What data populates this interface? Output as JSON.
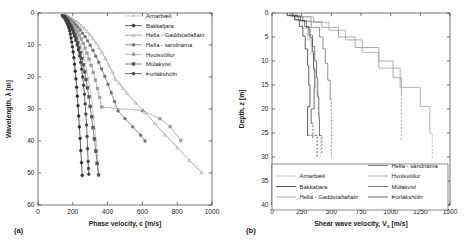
{
  "figure": {
    "panel_a_label": "(a)",
    "panel_b_label": "(b)"
  },
  "sites": [
    {
      "key": "arnarbaeli",
      "label": "Arnarbæli",
      "color": "#b9b9b9",
      "marker": "plus"
    },
    {
      "key": "bakkafjara",
      "label": "Bakkafjara",
      "color": "#2b2b2b",
      "marker": "circle-filled"
    },
    {
      "key": "hella_gaddstadaflatir",
      "label": "Hella - Gaddstaðaflatir",
      "color": "#8f8f8f",
      "marker": "triangle-open"
    },
    {
      "key": "hella_sandnama",
      "label": "Hella - sandnáma",
      "color": "#6e6e6e",
      "marker": "circle-filled"
    },
    {
      "key": "hvolsvollur",
      "label": "Hvolsvöllur",
      "color": "#9d9d9d",
      "marker": "square-filled"
    },
    {
      "key": "mulakvisl",
      "label": "Múlakvísl",
      "color": "#555555",
      "marker": "square-filled"
    },
    {
      "key": "thorlakshofn",
      "label": "Þorlákshöfn",
      "color": "#3f3f3f",
      "marker": "circle-filled"
    }
  ],
  "chart_data": [
    {
      "id": "panel-a",
      "type": "scatter",
      "title": "",
      "xlabel": "Phase velocity, c [m/s]",
      "ylabel": "Wavelength, λ [m]",
      "xlim": [
        0,
        1000
      ],
      "ylim": [
        0,
        60
      ],
      "y_inverted": true,
      "xticks": [
        0,
        200,
        400,
        600,
        800,
        1000
      ],
      "yticks": [
        0,
        10,
        20,
        30,
        40,
        50,
        60
      ],
      "grid": false,
      "legend_position": "top-right",
      "series": [
        {
          "name": "Arnarbæli",
          "x": [
            150,
            158,
            165,
            172,
            178,
            186,
            193,
            200,
            208,
            215,
            222,
            230,
            238,
            246,
            255,
            263,
            272,
            280,
            288,
            296,
            305,
            312,
            320,
            327,
            334,
            341,
            348
          ],
          "y": [
            1.0,
            1.4,
            1.8,
            2.2,
            2.7,
            3.2,
            3.8,
            4.4,
            5.1,
            5.9,
            6.8,
            7.8,
            9.0,
            10.4,
            12.0,
            13.8,
            15.8,
            18.0,
            20.4,
            23.0,
            26.0,
            29.2,
            32.6,
            36.2,
            40.0,
            44.5,
            49.6
          ]
        },
        {
          "name": "Bakkafjara",
          "x": [
            140,
            146,
            152,
            158,
            163,
            168,
            173,
            178,
            182,
            186,
            190,
            194,
            198,
            202,
            206,
            210,
            214,
            218,
            222,
            226,
            230,
            234,
            238,
            242,
            246,
            250,
            254
          ],
          "y": [
            0.8,
            1.2,
            1.6,
            2.1,
            2.6,
            3.2,
            3.9,
            4.7,
            5.6,
            6.6,
            7.8,
            9.1,
            10.6,
            12.2,
            14.0,
            16.0,
            18.2,
            20.6,
            23.2,
            26.0,
            29.0,
            32.2,
            35.6,
            39.2,
            43.0,
            46.8,
            50.8
          ]
        },
        {
          "name": "Hella - Gaddstaðaflatir",
          "x": [
            170,
            182,
            195,
            208,
            222,
            236,
            251,
            266,
            282,
            298,
            315,
            332,
            350,
            368,
            387,
            406,
            426,
            446,
            467,
            488,
            510,
            560,
            615,
            672,
            730,
            800,
            870,
            940
          ],
          "y": [
            0.9,
            1.3,
            1.7,
            2.2,
            2.7,
            3.3,
            4.0,
            4.8,
            5.7,
            6.7,
            7.9,
            9.2,
            10.7,
            12.3,
            14.1,
            16.1,
            18.3,
            20.7,
            22.0,
            23.5,
            25.0,
            28.0,
            31.0,
            34.5,
            38.0,
            42.0,
            46.0,
            49.8
          ]
        },
        {
          "name": "Hella - sandnáma",
          "x": [
            160,
            170,
            181,
            192,
            204,
            216,
            229,
            242,
            256,
            270,
            285,
            300,
            316,
            332,
            349,
            366,
            384,
            402,
            421,
            440,
            460,
            500,
            545,
            590,
            615
          ],
          "y": [
            1.0,
            1.4,
            1.9,
            2.4,
            3.0,
            3.7,
            4.4,
            5.3,
            6.3,
            7.4,
            8.7,
            10.1,
            11.7,
            13.5,
            15.4,
            17.5,
            19.8,
            22.3,
            24.9,
            27.7,
            30.6,
            33.0,
            35.6,
            38.2,
            40.0
          ]
        },
        {
          "name": "Hvolsvöllur",
          "x": [
            155,
            163,
            171,
            180,
            189,
            198,
            208,
            218,
            228,
            238,
            249,
            260,
            271,
            282,
            294,
            306,
            318,
            330,
            342,
            354,
            366,
            600,
            700,
            760,
            820
          ],
          "y": [
            1.0,
            1.4,
            1.9,
            2.4,
            3.0,
            3.6,
            4.3,
            5.1,
            6.0,
            7.0,
            8.2,
            9.5,
            11.0,
            12.6,
            14.4,
            16.4,
            18.6,
            21.0,
            23.6,
            26.4,
            29.4,
            30.5,
            33.0,
            35.5,
            39.8
          ]
        },
        {
          "name": "Múlakvísl",
          "x": [
            145,
            152,
            159,
            166,
            173,
            180,
            188,
            196,
            204,
            212,
            220,
            228,
            236,
            244,
            252,
            260,
            268,
            276,
            284,
            292,
            300,
            308,
            316,
            324,
            332,
            340,
            348
          ],
          "y": [
            0.9,
            1.3,
            1.7,
            2.2,
            2.8,
            3.4,
            4.1,
            4.9,
            5.8,
            6.8,
            8.0,
            9.3,
            10.8,
            12.4,
            14.2,
            16.2,
            18.4,
            20.8,
            23.4,
            26.2,
            29.2,
            32.4,
            35.8,
            39.4,
            43.2,
            47.0,
            50.6
          ]
        },
        {
          "name": "Þorlákshöfn",
          "x": [
            148,
            155,
            162,
            169,
            176,
            183,
            190,
            197,
            204,
            211,
            218,
            225,
            232,
            239,
            245,
            251,
            257,
            262,
            267,
            271,
            275,
            279,
            282,
            285,
            288,
            290,
            292
          ],
          "y": [
            0.9,
            1.3,
            1.7,
            2.2,
            2.8,
            3.5,
            4.3,
            5.2,
            6.2,
            7.3,
            8.6,
            10.0,
            11.6,
            13.4,
            15.4,
            17.6,
            20.0,
            22.6,
            25.4,
            28.4,
            31.6,
            35.0,
            38.6,
            42.4,
            46.4,
            48.6,
            50.4
          ]
        }
      ]
    },
    {
      "id": "panel-b",
      "type": "line",
      "title": "",
      "xlabel": "Shear wave velocity, V  [m/s]",
      "xlabel_main": "Shear wave velocity, V",
      "xlabel_sub": "s",
      "xlabel_unit": " [m/s]",
      "ylabel": "Depth, z [m]",
      "xlim": [
        0,
        1500
      ],
      "ylim": [
        0,
        40
      ],
      "y_inverted": true,
      "xticks": [
        0,
        250,
        500,
        750,
        1000,
        1250,
        1500
      ],
      "yticks": [
        0,
        5,
        10,
        15,
        20,
        25,
        30,
        35,
        40
      ],
      "grid": false,
      "legend_position": "bottom-center",
      "profiles": [
        {
          "name": "Arnarbæli",
          "style": "solid",
          "layers": [
            [
              120,
              0,
              0.6
            ],
            [
              200,
              0.6,
              1.6
            ],
            [
              255,
              1.6,
              3.2
            ],
            [
              300,
              3.2,
              5.6
            ],
            [
              330,
              5.6,
              8.5
            ],
            [
              350,
              8.5,
              12.0
            ],
            [
              370,
              12.0,
              16.5
            ],
            [
              390,
              16.5,
              21.0
            ],
            [
              400,
              21.0,
              25.5
            ]
          ],
          "halfspace": {
            "v": 410,
            "from": 25.5,
            "to": 30.0
          }
        },
        {
          "name": "Bakkafjara",
          "style": "solid",
          "layers": [
            [
              130,
              0,
              0.5
            ],
            [
              190,
              0.5,
              1.4
            ],
            [
              230,
              1.4,
              2.8
            ],
            [
              260,
              2.8,
              4.8
            ],
            [
              280,
              4.8,
              7.5
            ],
            [
              300,
              7.5,
              11.0
            ],
            [
              310,
              11.0,
              15.0
            ],
            [
              320,
              15.0,
              19.5
            ],
            [
              300,
              19.5,
              25.5
            ]
          ],
          "halfspace": {
            "v": 380,
            "from": 25.5,
            "to": 30.0
          }
        },
        {
          "name": "Hella - Gaddstaðaflatir",
          "style": "solid",
          "layers": [
            [
              200,
              0,
              0.8
            ],
            [
              330,
              0.8,
              1.8
            ],
            [
              420,
              1.8,
              3.0
            ],
            [
              560,
              3.0,
              5.0
            ],
            [
              700,
              5.0,
              7.2
            ],
            [
              900,
              7.2,
              10.0
            ],
            [
              1020,
              10.0,
              13.5
            ],
            [
              1090,
              13.5,
              17.0
            ]
          ],
          "halfspace": {
            "v": 1090,
            "from": 17.0,
            "to": 26.5
          }
        },
        {
          "name": "Hella - sandnáma",
          "style": "solid",
          "layers": [
            [
              180,
              0,
              0.7
            ],
            [
              260,
              0.7,
              1.7
            ],
            [
              330,
              1.7,
              3.0
            ],
            [
              400,
              3.0,
              5.0
            ],
            [
              430,
              5.0,
              7.5
            ],
            [
              450,
              7.5,
              10.5
            ],
            [
              470,
              10.5,
              14.0
            ],
            [
              490,
              14.0,
              18.0
            ]
          ],
          "halfspace": {
            "v": 500,
            "from": 18.0,
            "to": 30.0
          }
        },
        {
          "name": "Hvolsvöllur",
          "style": "solid",
          "layers": [
            [
              210,
              0,
              0.8
            ],
            [
              350,
              0.8,
              2.0
            ],
            [
              480,
              2.0,
              3.6
            ],
            [
              620,
              3.6,
              5.6
            ],
            [
              760,
              5.6,
              8.2
            ],
            [
              900,
              8.2,
              11.5
            ],
            [
              1080,
              11.5,
              15.5
            ],
            [
              1250,
              15.5,
              19.5
            ],
            [
              1330,
              19.5,
              25.0
            ]
          ],
          "halfspace": {
            "v": 1350,
            "from": 25.0,
            "to": 30.5
          }
        },
        {
          "name": "Múlakvísl",
          "style": "solid",
          "layers": [
            [
              150,
              0,
              0.6
            ],
            [
              220,
              0.6,
              1.5
            ],
            [
              275,
              1.5,
              2.8
            ],
            [
              310,
              2.8,
              4.6
            ],
            [
              340,
              4.6,
              7.0
            ],
            [
              360,
              7.0,
              10.0
            ],
            [
              375,
              10.0,
              13.5
            ],
            [
              385,
              13.5,
              17.5
            ],
            [
              395,
              17.5,
              22.0
            ],
            [
              400,
              22.0,
              25.5
            ]
          ],
          "halfspace": {
            "v": 420,
            "from": 25.5,
            "to": 29.5
          }
        },
        {
          "name": "Þorlákshöfn",
          "style": "solid",
          "layers": [
            [
              170,
              0,
              0.6
            ],
            [
              240,
              0.6,
              1.6
            ],
            [
              290,
              1.6,
              3.0
            ],
            [
              320,
              3.0,
              5.2
            ],
            [
              340,
              5.2,
              8.0
            ],
            [
              350,
              8.0,
              11.5
            ],
            [
              360,
              11.5,
              15.5
            ],
            [
              355,
              15.5,
              20.0
            ],
            [
              330,
              20.0,
              23.0
            ]
          ],
          "halfspace": {
            "v": 345,
            "from": 23.0,
            "to": 26.5
          }
        }
      ]
    }
  ]
}
